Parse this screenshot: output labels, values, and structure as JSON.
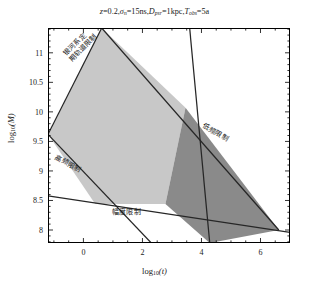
{
  "chart_data": {
    "type": "area",
    "title_parts": {
      "z_label": "z",
      "z_value": "=0.2,",
      "sigma_label": "σ",
      "sigma_sub": "n",
      "sigma_value": "=15ns,",
      "d_label": "D",
      "d_sub": "psr",
      "d_value": "=1kpc,",
      "t_label": "T",
      "t_sub": "obs",
      "t_value": "=5a"
    },
    "xlabel": "log₁₀(t)",
    "xlabel_parts": {
      "base": "log",
      "sub": "10",
      "arg": "(t)"
    },
    "ylabel": "log₁₀(M)",
    "ylabel_parts": {
      "base": "log",
      "sub": "10",
      "arg": "(M)"
    },
    "xlim": [
      -1.2,
      7.0
    ],
    "ylim": [
      7.78,
      11.42
    ],
    "xticks": [
      0,
      2,
      4,
      6
    ],
    "xtick_labels": [
      "0",
      "2",
      "4",
      "6"
    ],
    "yticks": [
      8,
      8.5,
      9,
      9.5,
      10,
      10.5,
      11
    ],
    "ytick_labels": [
      "8",
      "8.5",
      "9",
      "9.5",
      "10",
      "10.5",
      "11"
    ],
    "xminor_step": 0.5,
    "yminor_step": 0.1,
    "grid": false,
    "legend": "none",
    "colors": {
      "region_light": "#c8c8c8",
      "region_dark": "#8a8a8a",
      "line": "#262626",
      "frame": "#000000",
      "background": "#ffffff"
    },
    "regions": [
      {
        "name": "allowed-region-light",
        "fill": "#c8c8c8",
        "vertices": [
          [
            -1.2,
            9.62
          ],
          [
            0.62,
            11.42
          ],
          [
            3.46,
            10.07
          ],
          [
            2.78,
            8.44
          ],
          [
            0.4,
            8.44
          ]
        ]
      },
      {
        "name": "allowed-region-dark",
        "fill": "#8a8a8a",
        "vertices": [
          [
            3.46,
            10.07
          ],
          [
            6.62,
            8.0
          ],
          [
            4.28,
            7.78
          ],
          [
            2.78,
            8.44
          ]
        ]
      }
    ],
    "boundary_lines": [
      {
        "name": "galactic-orbit-limit",
        "label": "银河系定期轨道限制",
        "label_lines": [
          "银河系定",
          "期轨道限制"
        ],
        "p1": [
          -1.2,
          9.62
        ],
        "p2": [
          0.62,
          11.42
        ],
        "rotation": -45
      },
      {
        "name": "high-frequency-limit",
        "label": "高频限制",
        "p1": [
          -1.2,
          9.62
        ],
        "p2": [
          2.3,
          7.78
        ],
        "rotation": 28
      },
      {
        "name": "low-frequency-limit",
        "label": "低频限制",
        "p1": [
          0.62,
          11.42
        ],
        "p2": [
          6.62,
          8.0
        ],
        "rotation": 30
      },
      {
        "name": "amplitude-limit",
        "label": "幅度限制",
        "p1": [
          -1.2,
          8.58
        ],
        "p2": [
          7.0,
          7.96
        ],
        "rotation": 0
      },
      {
        "name": "detector-sensitivity-limit",
        "p1": [
          3.6,
          11.42
        ],
        "p2": [
          4.28,
          7.78
        ],
        "rotation": 0
      }
    ],
    "region_labels": [
      {
        "name": "galactic-orbit-limit-label",
        "lines": [
          "银河系定",
          "期轨道限制"
        ],
        "x": 62,
        "y": 52,
        "rotation": -45
      },
      {
        "name": "high-frequency-limit-label",
        "text": "高频限制",
        "x": 58,
        "y": 152,
        "rotation": 28
      },
      {
        "name": "low-frequency-limit-label",
        "text": "低频限制",
        "x": 206,
        "y": 120,
        "rotation": 30
      },
      {
        "name": "amplitude-limit-label",
        "text": "幅度限制",
        "x": 112,
        "y": 206,
        "rotation": 0
      }
    ]
  }
}
